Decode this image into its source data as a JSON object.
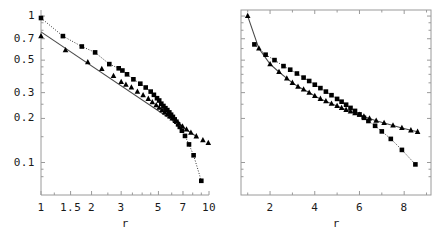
{
  "figure": {
    "background": "#ffffff",
    "frame_color": "#9a9a9a",
    "marker_color": "#000000",
    "panels": 2
  },
  "chart_data": [
    {
      "type": "scatter",
      "panel": "left",
      "title": "",
      "xlabel": "r",
      "ylabel": "",
      "xscale": "log",
      "yscale": "log",
      "xlim": [
        1,
        10
      ],
      "ylim": [
        0.06,
        1.1
      ],
      "grid": false,
      "legend": "none",
      "xticks": [
        1,
        1.5,
        2,
        3,
        5,
        7,
        10
      ],
      "xtick_labels": [
        "1",
        "1.5",
        "2",
        "3",
        "5",
        "7",
        "10"
      ],
      "yticks": [
        0.1,
        0.2,
        0.3,
        0.5,
        0.7,
        1
      ],
      "ytick_labels": [
        "0.1",
        "0.2",
        "0.3",
        "0.5",
        "0.7",
        "1"
      ],
      "series": [
        {
          "name": "squares",
          "marker": "square",
          "line": "dotted",
          "x": [
            1.0,
            1.35,
            1.75,
            2.1,
            2.55,
            2.9,
            3.05,
            3.25,
            3.55,
            3.9,
            4.2,
            4.5,
            4.7,
            4.9,
            5.05,
            5.2,
            5.35,
            5.5,
            5.65,
            5.8,
            5.95,
            6.1,
            6.25,
            6.4,
            6.55,
            6.7,
            6.9,
            7.2,
            7.6,
            8.1,
            9.0
          ],
          "y": [
            0.97,
            0.73,
            0.62,
            0.565,
            0.47,
            0.44,
            0.425,
            0.4,
            0.37,
            0.345,
            0.325,
            0.305,
            0.29,
            0.275,
            0.265,
            0.252,
            0.243,
            0.235,
            0.228,
            0.22,
            0.212,
            0.205,
            0.197,
            0.19,
            0.182,
            0.175,
            0.165,
            0.152,
            0.133,
            0.112,
            0.075
          ]
        },
        {
          "name": "triangles",
          "marker": "triangle",
          "line": "solid-fit",
          "x": [
            1.0,
            1.4,
            1.9,
            2.3,
            2.7,
            3.0,
            3.2,
            3.45,
            3.75,
            4.05,
            4.35,
            4.6,
            4.85,
            5.05,
            5.25,
            5.45,
            5.65,
            5.85,
            6.05,
            6.3,
            6.6,
            6.95,
            7.35,
            7.8,
            8.4,
            9.2,
            9.9
          ],
          "y": [
            0.73,
            0.585,
            0.485,
            0.435,
            0.39,
            0.355,
            0.34,
            0.325,
            0.305,
            0.288,
            0.272,
            0.258,
            0.246,
            0.237,
            0.228,
            0.22,
            0.213,
            0.206,
            0.2,
            0.192,
            0.184,
            0.176,
            0.168,
            0.16,
            0.151,
            0.142,
            0.136
          ],
          "fit_line": {
            "x": [
              1.0,
              8.6
            ],
            "y": [
              0.78,
              0.148
            ]
          }
        }
      ]
    },
    {
      "type": "scatter",
      "panel": "right",
      "title": "",
      "xlabel": "r",
      "ylabel": "",
      "xscale": "linear",
      "yscale": "log",
      "xlim": [
        0.7,
        9.2
      ],
      "ylim": [
        0.06,
        1.1
      ],
      "grid": false,
      "legend": "none",
      "xticks": [
        2,
        4,
        6,
        8
      ],
      "xtick_labels": [
        "2",
        "4",
        "6",
        "8"
      ],
      "yticks": [
        0.1,
        0.2,
        0.3,
        0.5,
        0.7,
        1
      ],
      "ytick_labels": [
        "",
        "",
        "",
        "",
        "",
        ""
      ],
      "series": [
        {
          "name": "triangles",
          "marker": "triangle",
          "line": "solid-fit",
          "x": [
            1.0,
            1.5,
            2.0,
            2.4,
            2.75,
            3.0,
            3.25,
            3.5,
            3.75,
            4.0,
            4.25,
            4.5,
            4.75,
            5.0,
            5.2,
            5.4,
            5.6,
            5.8,
            6.0,
            6.2,
            6.45,
            6.75,
            7.1,
            7.5,
            7.9,
            8.3,
            8.6
          ],
          "y": [
            1.0,
            0.6,
            0.47,
            0.415,
            0.375,
            0.35,
            0.33,
            0.315,
            0.3,
            0.285,
            0.272,
            0.262,
            0.252,
            0.243,
            0.236,
            0.229,
            0.223,
            0.217,
            0.212,
            0.206,
            0.2,
            0.193,
            0.186,
            0.179,
            0.172,
            0.166,
            0.162
          ]
        },
        {
          "name": "squares",
          "marker": "square",
          "line": "dotted",
          "x": [
            1.3,
            1.8,
            2.2,
            2.6,
            2.9,
            3.2,
            3.5,
            3.75,
            4.0,
            4.25,
            4.5,
            4.75,
            5.0,
            5.2,
            5.4,
            5.6,
            5.8,
            6.0,
            6.2,
            6.4,
            6.7,
            7.0,
            7.4,
            7.9,
            8.5
          ],
          "y": [
            0.64,
            0.545,
            0.5,
            0.455,
            0.43,
            0.405,
            0.38,
            0.36,
            0.34,
            0.322,
            0.305,
            0.288,
            0.272,
            0.26,
            0.248,
            0.236,
            0.225,
            0.213,
            0.202,
            0.192,
            0.178,
            0.163,
            0.145,
            0.122,
            0.097
          ]
        }
      ]
    }
  ]
}
